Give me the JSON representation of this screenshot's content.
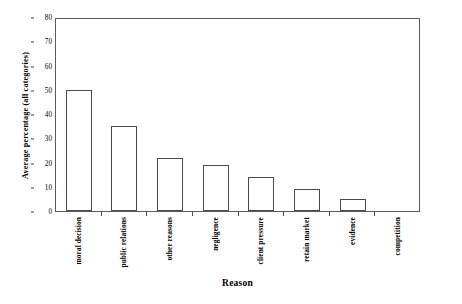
{
  "chart_data": {
    "type": "bar",
    "title": "",
    "subtitle": "",
    "xlabel": "Reason",
    "ylabel": "Average percentage (all categories)",
    "categories": [
      "moral decision",
      "public relations",
      "other reasons",
      "negligence",
      "client pressure",
      "retain market",
      "evidence",
      "competition"
    ],
    "values": [
      50,
      35,
      22,
      19,
      14,
      9,
      5,
      0
    ],
    "ylim": [
      0,
      80
    ],
    "ytick_labels": [
      "0",
      "10",
      "20",
      "30",
      "40",
      "50",
      "60",
      "70",
      "80"
    ],
    "ytick_values": [
      0,
      10,
      20,
      30,
      40,
      50,
      60,
      70,
      80
    ],
    "grid": false,
    "legend": null,
    "legend_position": "none",
    "annotations": [],
    "bar_fill_color": "#ffffff",
    "bar_edge_color": "#4a4a4a",
    "axis_color": "#5a5a5a",
    "background_color": "#ffffff",
    "text_color": "#000000"
  }
}
